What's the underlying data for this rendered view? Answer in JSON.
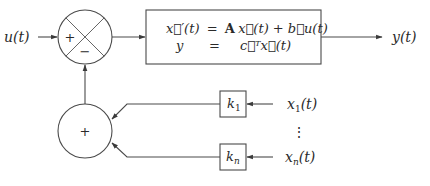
{
  "diagram": {
    "type": "block-diagram",
    "input_label": "u(t)",
    "output_label": "y(t)",
    "summing_junction_top": {
      "plus": "+",
      "minus": "−"
    },
    "summing_junction_bottom": {
      "plus": "+"
    },
    "plant": {
      "eq1_lhs": "x⃗′(t)",
      "eq1_eq": "=",
      "eq1_rhs_A": "A",
      "eq1_rhs_rest": "x⃗(t) + b⃗u(t)",
      "eq2_lhs": "y",
      "eq2_eq": "=",
      "eq2_rhs": "c⃗ᵀx⃗(t)"
    },
    "gains": [
      {
        "label": "k",
        "sub": "1",
        "state_label": "x",
        "state_sub": "1",
        "state_suffix": "(t)"
      },
      {
        "label": "k",
        "sub": "n",
        "state_label": "x",
        "state_sub": "n",
        "state_suffix": "(t)"
      }
    ],
    "ellipsis": "⋮",
    "colors": {
      "line": "#4a4a4a",
      "text": "#2a2a2a",
      "background": "#ffffff"
    }
  }
}
